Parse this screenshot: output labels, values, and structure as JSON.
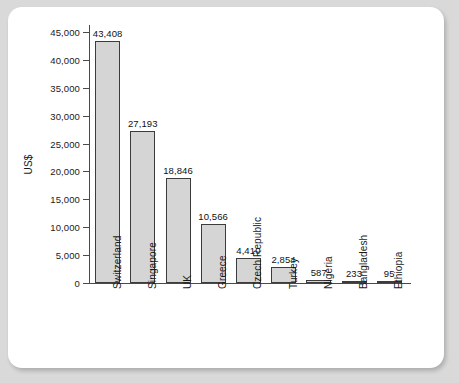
{
  "chart_data": {
    "type": "bar",
    "title": "",
    "subtitle": "",
    "xlabel": "",
    "ylabel": "US$",
    "ylim": [
      0,
      45000
    ],
    "ytick_labels": [
      "45,000",
      "40,000",
      "35,000",
      "30,000",
      "25,000",
      "20,000",
      "15,000",
      "10,000",
      "5,000",
      "0"
    ],
    "yticks": [
      45000,
      40000,
      35000,
      30000,
      25000,
      20000,
      15000,
      10000,
      5000,
      0
    ],
    "grid": false,
    "legend": null,
    "legend_position": "none",
    "categories": [
      "Switzerland",
      "Singapore",
      "UK",
      "Greece",
      "Czech Republic",
      "Turkey",
      "Nigeria",
      "Bangladesh",
      "Ethiopia"
    ],
    "values": [
      43408,
      27193,
      18846,
      10566,
      4410,
      2854,
      587,
      233,
      95
    ],
    "value_labels": [
      "43,408",
      "27,193",
      "18,846",
      "10,566",
      "4,410",
      "2,854",
      "587",
      "233",
      "95"
    ],
    "bar_fill_color": "#d5d5d5",
    "bar_edge_color": "#3c3c3c",
    "axis_color": "#4a4a4a",
    "card_background": "#ffffff",
    "page_background": "#d9d9d9"
  }
}
